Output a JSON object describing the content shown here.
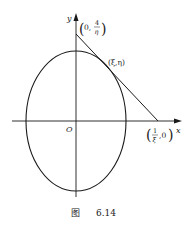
{
  "figure": {
    "caption_prefix": "图",
    "caption_number": "6.14",
    "axes": {
      "x_label": "x",
      "y_label": "y",
      "origin_label": "O"
    },
    "points": {
      "y_intercept": {
        "open": "(",
        "first": "0,",
        "num": "4",
        "den": "η",
        "close": ")"
      },
      "tangent_point": "(ξ,η)",
      "x_intercept": {
        "open": "(",
        "num": "1",
        "den": "ξ",
        "rest": ",0",
        "close": ")"
      }
    },
    "colors": {
      "stroke": "#1a1a1a",
      "text": "#222222",
      "background": "#ffffff"
    }
  }
}
